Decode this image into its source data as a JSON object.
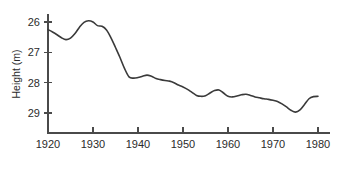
{
  "chart_data": {
    "type": "line",
    "title": "",
    "xlabel": "",
    "ylabel": "Height (m)",
    "xlim": [
      1920,
      1981
    ],
    "ylim": [
      25.6,
      29.6
    ],
    "y_axis_inverted": true,
    "grid": false,
    "legend": null,
    "xticks": [
      1920,
      1930,
      1940,
      1950,
      1960,
      1970,
      1980
    ],
    "xtick_labels": [
      "1920",
      "1930",
      "1940",
      "1950",
      "1960",
      "1970",
      "1980"
    ],
    "yticks": [
      26,
      27,
      28,
      29
    ],
    "ytick_labels": [
      "26",
      "27",
      "28",
      "29"
    ],
    "line_color": "#3a3a3a",
    "axis_color": "#4a4a4a",
    "background_color": "#ffffff",
    "series": [
      {
        "name": "Height",
        "x": [
          1920,
          1921,
          1922,
          1923,
          1924,
          1925,
          1926,
          1927,
          1928,
          1929,
          1930,
          1931,
          1932,
          1933,
          1934,
          1935,
          1936,
          1937,
          1938,
          1939,
          1940,
          1941,
          1942,
          1943,
          1944,
          1945,
          1946,
          1947,
          1948,
          1949,
          1950,
          1951,
          1952,
          1953,
          1954,
          1955,
          1956,
          1957,
          1958,
          1959,
          1960,
          1961,
          1962,
          1963,
          1964,
          1965,
          1966,
          1967,
          1968,
          1969,
          1970,
          1971,
          1972,
          1973,
          1974,
          1975,
          1976,
          1977,
          1978,
          1979,
          1980
        ],
        "values": [
          26.25,
          26.33,
          26.42,
          26.52,
          26.58,
          26.53,
          26.38,
          26.17,
          26.01,
          25.96,
          26.0,
          26.12,
          26.14,
          26.26,
          26.52,
          26.84,
          27.17,
          27.53,
          27.81,
          27.85,
          27.83,
          27.79,
          27.75,
          27.79,
          27.86,
          27.9,
          27.93,
          27.95,
          28.0,
          28.08,
          28.14,
          28.22,
          28.32,
          28.42,
          28.45,
          28.43,
          28.34,
          28.26,
          28.24,
          28.34,
          28.45,
          28.47,
          28.44,
          28.4,
          28.38,
          28.42,
          28.47,
          28.5,
          28.53,
          28.55,
          28.58,
          28.62,
          28.7,
          28.8,
          28.91,
          28.97,
          28.9,
          28.72,
          28.53,
          28.46,
          28.45
        ]
      }
    ]
  },
  "axis": {
    "ylabel": "Height (m)"
  }
}
